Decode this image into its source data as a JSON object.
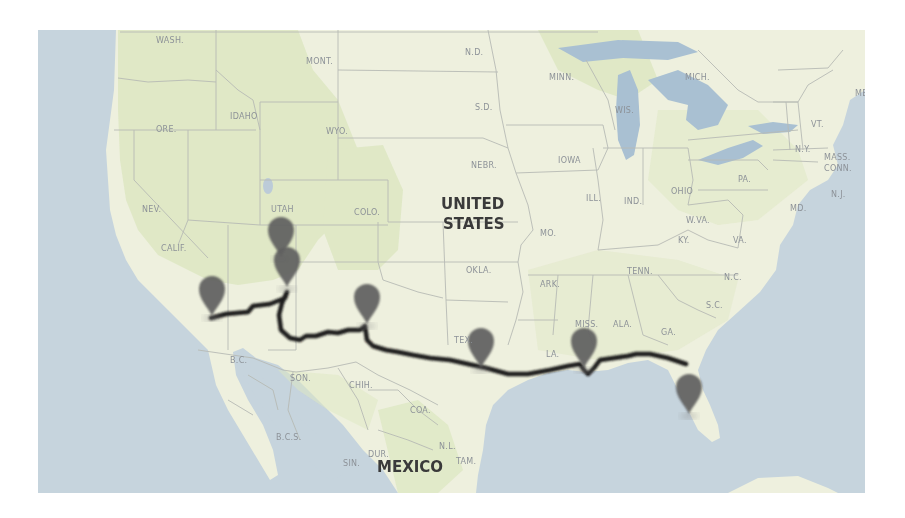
{
  "map": {
    "country_labels": [
      {
        "name": "united-states",
        "lines": [
          "UNITED",
          "STATES"
        ]
      },
      {
        "name": "mexico",
        "lines": [
          "MEXICO"
        ]
      }
    ],
    "state_labels": {
      "wash": "WASH.",
      "ore": "ORE.",
      "idaho": "IDAHO",
      "mont": "MONT.",
      "wyo": "WYO.",
      "nd": "N.D.",
      "sd": "S.D.",
      "nebr": "NEBR.",
      "minn": "MINN.",
      "iowa": "IOWA",
      "wis": "WIS.",
      "mich": "MICH.",
      "nev": "NEV.",
      "utah": "UTAH",
      "colo": "COLO.",
      "calif": "CALIF.",
      "okla": "OKLA.",
      "mo": "MO.",
      "ill": "ILL.",
      "ind": "IND.",
      "ohio": "OHIO",
      "pa": "PA.",
      "ny": "N.Y.",
      "vt": "VT.",
      "mass": "MASS.",
      "conn": "CONN.",
      "me": "ME",
      "md": "MD.",
      "nj": "N.J.",
      "wva": "W.VA.",
      "va": "VA.",
      "ky": "KY.",
      "tenn": "TENN.",
      "nc": "N.C.",
      "sc": "S.C.",
      "ark": "ARK.",
      "miss": "MISS.",
      "ala": "ALA.",
      "ga": "GA.",
      "la": "LA.",
      "tex": "TEX.",
      "son": "SON.",
      "chih": "CHIH.",
      "coa": "COA.",
      "bc": "B.C.",
      "bcs": "B.C.S.",
      "dur": "DUR.",
      "sin": "SIN.",
      "nl": "N.L.",
      "tam": "TAM."
    },
    "markers": [
      {
        "name": "marker-los-angeles",
        "label": "Los Angeles area"
      },
      {
        "name": "marker-utah-south",
        "label": "Southern Utah"
      },
      {
        "name": "marker-grand-canyon",
        "label": "Northern Arizona"
      },
      {
        "name": "marker-new-mexico",
        "label": "Southern New Mexico"
      },
      {
        "name": "marker-texas",
        "label": "Central Texas"
      },
      {
        "name": "marker-new-orleans",
        "label": "New Orleans area"
      },
      {
        "name": "marker-florida",
        "label": "West Florida"
      }
    ],
    "colors": {
      "water": "#c6d4dd",
      "land": "#eef0de",
      "land_green": "#dfe8c6",
      "border": "#b4b7b2",
      "route": "#1c1a1a",
      "marker": "#5e5e5e"
    }
  }
}
